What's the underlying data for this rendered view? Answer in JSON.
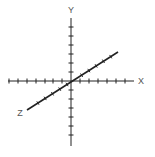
{
  "diagram": {
    "colors": {
      "axis": "#222222",
      "label": "#555555",
      "background": "#ffffff"
    },
    "origin": {
      "x": 71,
      "y": 81
    },
    "axes": [
      {
        "name": "X",
        "label": "X",
        "label_pos": {
          "x": 141,
          "y": 84
        },
        "from": {
          "x": 8,
          "y": 81
        },
        "to": {
          "x": 134,
          "y": 81
        },
        "ticks": [
          9,
          18,
          27,
          36,
          45,
          53,
          62,
          80,
          89,
          98,
          107,
          116,
          125
        ],
        "tick_orientation": "vertical"
      },
      {
        "name": "Y",
        "label": "Y",
        "label_pos": {
          "x": 71,
          "y": 13
        },
        "from": {
          "x": 71,
          "y": 18
        },
        "to": {
          "x": 71,
          "y": 146
        },
        "ticks": [
          27,
          36,
          45,
          54,
          63,
          72,
          90,
          99,
          108,
          117,
          126,
          135
        ],
        "tick_orientation": "horizontal"
      },
      {
        "name": "Z",
        "label": "Z",
        "label_pos": {
          "x": 20,
          "y": 116
        },
        "from": {
          "x": 27,
          "y": 110
        },
        "to": {
          "x": 118,
          "y": 52
        },
        "ticks": [
          0.12,
          0.2,
          0.28,
          0.36,
          0.44,
          0.6,
          0.68,
          0.76,
          0.84,
          0.92
        ],
        "tick_orientation": "perpendicular"
      }
    ]
  }
}
